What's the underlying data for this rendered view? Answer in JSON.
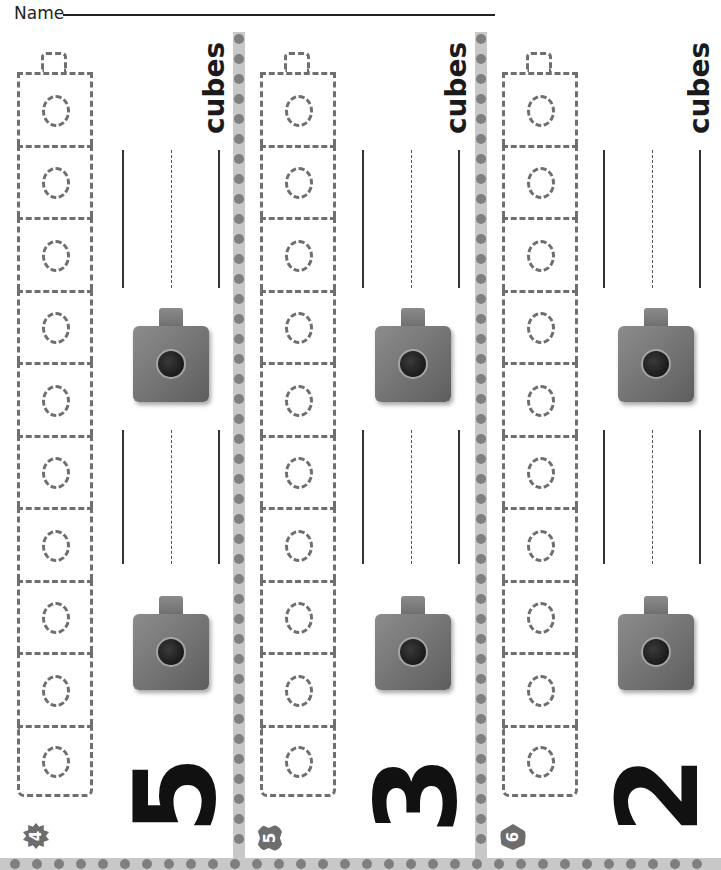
{
  "header": {
    "name_label": "Name"
  },
  "problems": [
    {
      "badge_number": "4",
      "badge_shape": "flower-icon",
      "given_number": "5",
      "unit_label": "cubes",
      "tower_cubes": 10
    },
    {
      "badge_number": "5",
      "badge_shape": "cloud-icon",
      "given_number": "3",
      "unit_label": "cubes",
      "tower_cubes": 10
    },
    {
      "badge_number": "6",
      "badge_shape": "shield-icon",
      "given_number": "2",
      "unit_label": "cubes",
      "tower_cubes": 10
    }
  ],
  "colors": {
    "dash": "#6f6f6f",
    "divider": "#c8c8c8",
    "dot": "#7f7f7f",
    "cube": "#7a7a7a",
    "text": "#111111"
  }
}
